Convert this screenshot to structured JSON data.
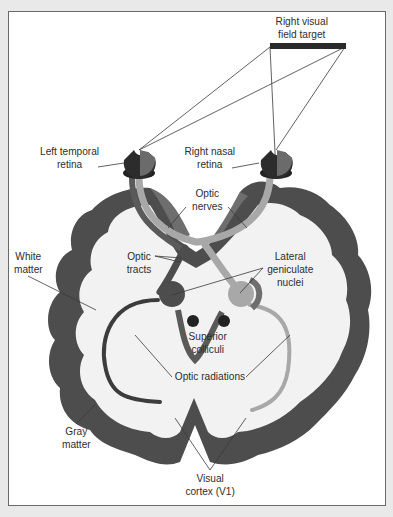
{
  "diagram": {
    "type": "anatomy-visual-pathway",
    "labels": {
      "target": [
        "Right visual",
        "field target"
      ],
      "left_retina": [
        "Left temporal",
        "retina"
      ],
      "right_retina": [
        "Right nasal",
        "retina"
      ],
      "optic_nerves": [
        "Optic",
        "nerves"
      ],
      "white_matter": [
        "White",
        "matter"
      ],
      "optic_tracts": [
        "Optic",
        "tracts"
      ],
      "lgn": [
        "Lateral",
        "geniculate",
        "nuclei"
      ],
      "superior_colliculi": [
        "Superior",
        "colliculi"
      ],
      "optic_radiations": [
        "Optic radiations"
      ],
      "gray_matter": [
        "Gray",
        "matter"
      ],
      "visual_cortex": [
        "Visual",
        "cortex (V1)"
      ]
    },
    "colors": {
      "background": "#e9e9e9",
      "panel": "#ffffff",
      "frame": "#6a6a6a",
      "gray_matter_dark": "#4a4a4a",
      "gray_matter_mid": "#6b6b6b",
      "white_matter": "#f0f0f0",
      "light_pathway": "#a8a8a8",
      "dark_pathway": "#3c3c3c",
      "target_bar": "#2a2a2a",
      "text": "#2e2e2e"
    }
  }
}
